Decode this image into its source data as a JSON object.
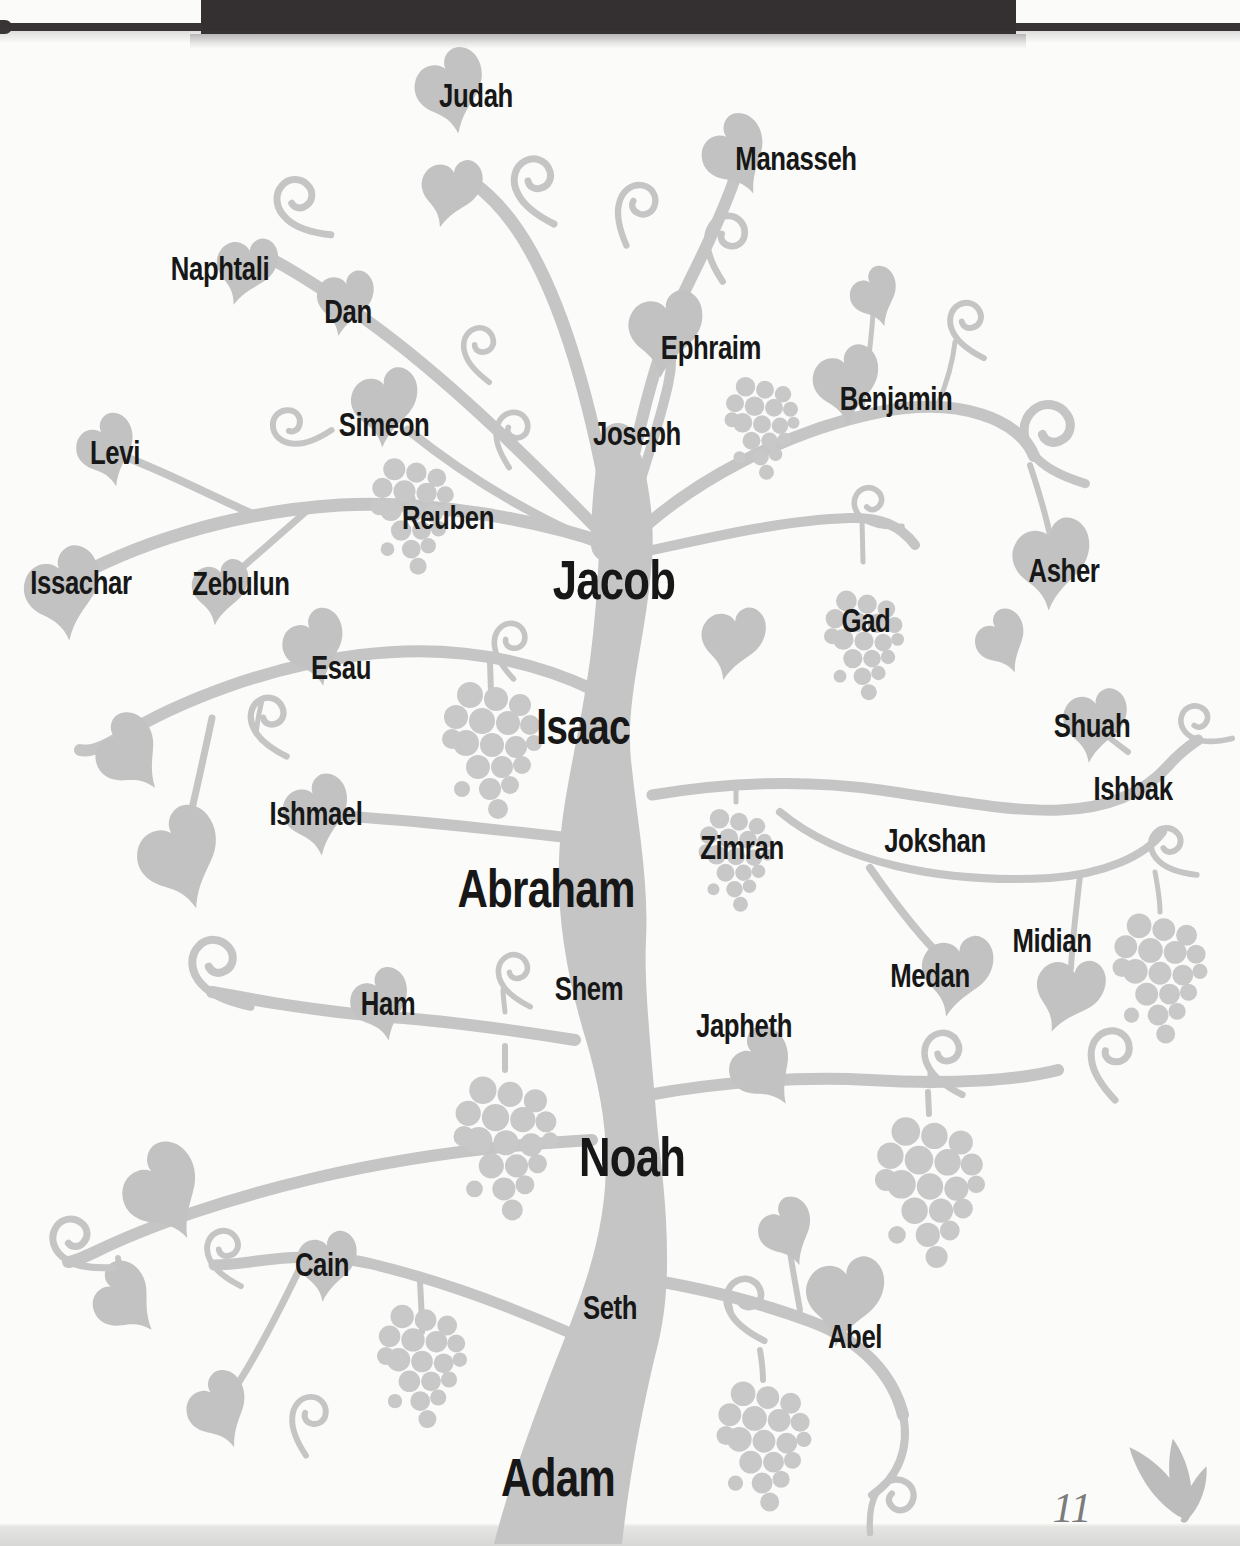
{
  "page": {
    "number": "11",
    "palette": {
      "background": "#fbfbfa",
      "header_bar": "#343031",
      "vine_gray": "#c5c5c5",
      "leaf_gray": "#c2c2c2",
      "grape_gray": "#c8c8c8",
      "label_text": "#171717",
      "page_number_gray": "#7c7c7c",
      "footer_strip": "#d7d7d5"
    },
    "icons": [
      "leaf-icon",
      "tendril-icon",
      "grape-cluster-icon",
      "corner-flourish-icon"
    ]
  },
  "tree": {
    "patriarch_line": [
      "Adam",
      "Seth",
      "Noah",
      "Shem",
      "Abraham",
      "Isaac",
      "Jacob"
    ],
    "generations": [
      {
        "father": "Adam",
        "sons": [
          "Cain",
          "Seth",
          "Abel"
        ]
      },
      {
        "father": "Noah",
        "sons": [
          "Shem",
          "Ham",
          "Japheth"
        ]
      },
      {
        "father": "Abraham",
        "sons": [
          "Ishmael",
          "Isaac",
          "Zimran",
          "Jokshan",
          "Medan",
          "Midian",
          "Ishbak",
          "Shuah"
        ]
      },
      {
        "father": "Isaac",
        "sons": [
          "Esau",
          "Jacob"
        ]
      },
      {
        "father": "Jacob",
        "sons": [
          "Reuben",
          "Simeon",
          "Levi",
          "Judah",
          "Dan",
          "Naphtali",
          "Gad",
          "Asher",
          "Issachar",
          "Zebulun",
          "Joseph",
          "Benjamin"
        ]
      },
      {
        "father": "Joseph",
        "sons": [
          "Manasseh",
          "Ephraim"
        ]
      }
    ],
    "labels": [
      {
        "text": "Judah",
        "x": 476,
        "y": 95,
        "font_px": 33,
        "emphasis": "normal"
      },
      {
        "text": "Manasseh",
        "x": 796,
        "y": 158,
        "font_px": 33,
        "emphasis": "normal"
      },
      {
        "text": "Naphtali",
        "x": 220,
        "y": 268,
        "font_px": 33,
        "emphasis": "normal"
      },
      {
        "text": "Dan",
        "x": 348,
        "y": 311,
        "font_px": 33,
        "emphasis": "normal"
      },
      {
        "text": "Ephraim",
        "x": 711,
        "y": 347,
        "font_px": 33,
        "emphasis": "normal"
      },
      {
        "text": "Benjamin",
        "x": 896,
        "y": 398,
        "font_px": 33,
        "emphasis": "normal"
      },
      {
        "text": "Simeon",
        "x": 384,
        "y": 424,
        "font_px": 33,
        "emphasis": "normal"
      },
      {
        "text": "Joseph",
        "x": 637,
        "y": 433,
        "font_px": 33,
        "emphasis": "normal"
      },
      {
        "text": "Levi",
        "x": 115,
        "y": 452,
        "font_px": 33,
        "emphasis": "normal"
      },
      {
        "text": "Reuben",
        "x": 448,
        "y": 517,
        "font_px": 33,
        "emphasis": "normal"
      },
      {
        "text": "Asher",
        "x": 1064,
        "y": 570,
        "font_px": 33,
        "emphasis": "normal"
      },
      {
        "text": "Issachar",
        "x": 81,
        "y": 582,
        "font_px": 33,
        "emphasis": "normal"
      },
      {
        "text": "Zebulun",
        "x": 241,
        "y": 583,
        "font_px": 33,
        "emphasis": "normal"
      },
      {
        "text": "Jacob",
        "x": 614,
        "y": 580,
        "font_px": 56,
        "emphasis": "large"
      },
      {
        "text": "Gad",
        "x": 866,
        "y": 620,
        "font_px": 33,
        "emphasis": "normal"
      },
      {
        "text": "Esau",
        "x": 341,
        "y": 667,
        "font_px": 33,
        "emphasis": "normal"
      },
      {
        "text": "Shuah",
        "x": 1092,
        "y": 725,
        "font_px": 33,
        "emphasis": "normal"
      },
      {
        "text": "Isaac",
        "x": 583,
        "y": 727,
        "font_px": 50,
        "emphasis": "large"
      },
      {
        "text": "Ishbak",
        "x": 1133,
        "y": 788,
        "font_px": 33,
        "emphasis": "normal"
      },
      {
        "text": "Ishmael",
        "x": 316,
        "y": 813,
        "font_px": 33,
        "emphasis": "normal"
      },
      {
        "text": "Jokshan",
        "x": 935,
        "y": 840,
        "font_px": 33,
        "emphasis": "normal"
      },
      {
        "text": "Zimran",
        "x": 742,
        "y": 847,
        "font_px": 33,
        "emphasis": "normal"
      },
      {
        "text": "Abraham",
        "x": 546,
        "y": 888,
        "font_px": 54,
        "emphasis": "large"
      },
      {
        "text": "Midian",
        "x": 1052,
        "y": 940,
        "font_px": 33,
        "emphasis": "normal"
      },
      {
        "text": "Medan",
        "x": 930,
        "y": 975,
        "font_px": 33,
        "emphasis": "normal"
      },
      {
        "text": "Shem",
        "x": 589,
        "y": 988,
        "font_px": 33,
        "emphasis": "normal"
      },
      {
        "text": "Ham",
        "x": 388,
        "y": 1003,
        "font_px": 33,
        "emphasis": "normal"
      },
      {
        "text": "Japheth",
        "x": 744,
        "y": 1025,
        "font_px": 33,
        "emphasis": "normal"
      },
      {
        "text": "Noah",
        "x": 632,
        "y": 1157,
        "font_px": 56,
        "emphasis": "large"
      },
      {
        "text": "Cain",
        "x": 322,
        "y": 1264,
        "font_px": 33,
        "emphasis": "normal"
      },
      {
        "text": "Seth",
        "x": 610,
        "y": 1307,
        "font_px": 33,
        "emphasis": "normal"
      },
      {
        "text": "Abel",
        "x": 855,
        "y": 1336,
        "font_px": 33,
        "emphasis": "normal"
      },
      {
        "text": "Adam",
        "x": 558,
        "y": 1477,
        "font_px": 54,
        "emphasis": "large"
      }
    ]
  }
}
